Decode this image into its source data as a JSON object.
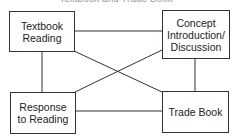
{
  "diagram": {
    "title_partial": "Textbook and Trade Book",
    "nodes": [
      {
        "id": "textbook-reading",
        "label": "Textbook\nReading",
        "line1": "Textbook",
        "line2": "Reading"
      },
      {
        "id": "concept",
        "label": "Concept Introduction/ Discussion",
        "line1": "Concept",
        "line2": "Introduction/",
        "line3": "Discussion"
      },
      {
        "id": "response",
        "label": "Response to Reading",
        "line1": "Response",
        "line2": "to Reading"
      },
      {
        "id": "trade-book",
        "label": "Trade Book",
        "line1": "Trade Book"
      }
    ],
    "edges": [
      [
        "textbook-reading",
        "concept"
      ],
      [
        "textbook-reading",
        "response"
      ],
      [
        "textbook-reading",
        "trade-book"
      ],
      [
        "concept",
        "response"
      ],
      [
        "concept",
        "trade-book"
      ],
      [
        "response",
        "trade-book"
      ]
    ]
  }
}
